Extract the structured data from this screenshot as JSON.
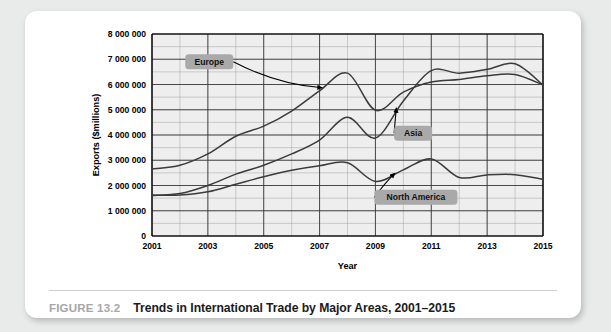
{
  "figure": {
    "number": "FIGURE 13.2",
    "title": "Trends in International Trade by Major Areas, 2001–2015"
  },
  "chart_data": {
    "type": "line",
    "title": "Trends in International Trade by Major Areas, 2001–2015",
    "xlabel": "Year",
    "ylabel": "Exports ($millions)",
    "xlim": [
      2001,
      2015
    ],
    "ylim": [
      0,
      8000000
    ],
    "ytick_step": 1000000,
    "yminor_step": 500000,
    "xtick_step": 2,
    "xminor_step": 1,
    "grid": true,
    "legend": "callout-labels",
    "ytick_labels": [
      "0",
      "1 000 000",
      "2 000 000",
      "3 000 000",
      "4 000 000",
      "5 000 000",
      "6 000 000",
      "7 000 000",
      "8 000 000"
    ],
    "ytick_values": [
      0,
      1000000,
      2000000,
      3000000,
      4000000,
      5000000,
      6000000,
      7000000,
      8000000
    ],
    "xtick_labels": [
      "2001",
      "2003",
      "2005",
      "2007",
      "2009",
      "2011",
      "2013",
      "2015"
    ],
    "xtick_values": [
      2001,
      2003,
      2005,
      2007,
      2009,
      2011,
      2013,
      2015
    ],
    "x": [
      2001,
      2002,
      2003,
      2004,
      2005,
      2006,
      2007,
      2008,
      2009,
      2010,
      2011,
      2012,
      2013,
      2014,
      2015
    ],
    "series": [
      {
        "name": "Europe",
        "values": [
          2650000,
          2800000,
          3250000,
          3950000,
          4350000,
          4950000,
          5750000,
          6450000,
          4980000,
          5700000,
          6100000,
          6200000,
          6350000,
          6400000,
          5980000
        ]
      },
      {
        "name": "Asia",
        "values": [
          1600000,
          1680000,
          2000000,
          2450000,
          2800000,
          3250000,
          3800000,
          4700000,
          3880000,
          5350000,
          6550000,
          6450000,
          6600000,
          6820000,
          5980000
        ]
      },
      {
        "name": "North America",
        "values": [
          1620000,
          1620000,
          1750000,
          2050000,
          2350000,
          2600000,
          2780000,
          2900000,
          2160000,
          2620000,
          3050000,
          2320000,
          2420000,
          2430000,
          2250000
        ]
      }
    ],
    "annotations": [
      {
        "label": "Europe",
        "box_x": 2003.05,
        "box_y": 6900000,
        "arrow_to_x": 2007.1,
        "arrow_to_y": 5870000
      },
      {
        "label": "Asia",
        "box_x": 2010.35,
        "box_y": 4070000,
        "arrow_to_x": 2009.75,
        "arrow_to_y": 5080000
      },
      {
        "label": "North America",
        "box_x": 2010.45,
        "box_y": 1530000,
        "arrow_to_x": 2009.7,
        "arrow_to_y": 2490000
      }
    ]
  },
  "colors": {
    "plot_background": "#eeeeee",
    "line": "#3b3b3b",
    "callout_fill": "#a9a9a9",
    "grid_major": "#333333",
    "grid_minor": "#9a9a9a",
    "figure_number": "#a6a6a6",
    "card": "#ffffff",
    "page_background": "#e9eaea"
  }
}
